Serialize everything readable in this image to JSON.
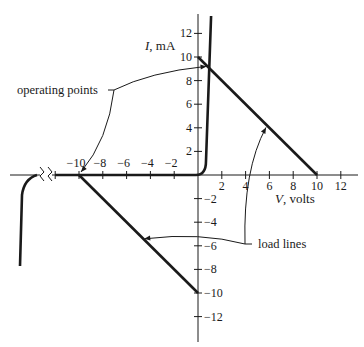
{
  "diagram": {
    "title": "",
    "x_axis": {
      "label_var": "V",
      "label_unit": ", volts",
      "range": [
        -13,
        13.5
      ],
      "ticks": [
        -12,
        -10,
        -8,
        -6,
        -4,
        -2,
        2,
        4,
        6,
        8,
        10,
        12
      ],
      "tick_labels": [
        {
          "value": -10,
          "text": "−10"
        },
        {
          "value": -8,
          "text": "−8"
        },
        {
          "value": -6,
          "text": "−6"
        },
        {
          "value": -4,
          "text": "−4"
        },
        {
          "value": -2,
          "text": "−2"
        },
        {
          "value": 2,
          "text": "2"
        },
        {
          "value": 4,
          "text": "4"
        },
        {
          "value": 6,
          "text": "6"
        },
        {
          "value": 8,
          "text": "8"
        },
        {
          "value": 10,
          "text": "10"
        },
        {
          "value": 12,
          "text": "12"
        }
      ],
      "break_marks": true
    },
    "y_axis": {
      "label_var": "I",
      "label_unit": ", mA",
      "range": [
        -14,
        13.5
      ],
      "ticks": [
        12,
        10,
        8,
        6,
        4,
        2,
        -2,
        -4,
        -6,
        -8,
        -10,
        -12
      ],
      "tick_labels": [
        {
          "value": 12,
          "text": "12"
        },
        {
          "value": 10,
          "text": "10"
        },
        {
          "value": 8,
          "text": "8"
        },
        {
          "value": 6,
          "text": "6"
        },
        {
          "value": 4,
          "text": "4"
        },
        {
          "value": 2,
          "text": "2"
        },
        {
          "value": -2,
          "text": "−2"
        },
        {
          "value": -4,
          "text": "−4"
        },
        {
          "value": -6,
          "text": "−6"
        },
        {
          "value": -8,
          "text": "−8"
        },
        {
          "value": -10,
          "text": "−10"
        },
        {
          "value": -12,
          "text": "−12"
        }
      ]
    },
    "curves": {
      "diode_characteristic": {
        "description": "Diode I-V curve: flat at I=0 for negative V, sharp rise near V≈0.7",
        "points": [
          [
            -12,
            0
          ],
          [
            0,
            0
          ],
          [
            0.6,
            0.6
          ],
          [
            0.75,
            2
          ],
          [
            1.0,
            13.2
          ]
        ]
      },
      "reverse_breakdown": {
        "description": "Reverse breakdown beyond axis break",
        "points_px_note": "drawn left of break marks"
      },
      "load_line_forward": {
        "from": [
          0,
          10
        ],
        "to": [
          10,
          0
        ]
      },
      "load_line_reverse": {
        "from": [
          -10,
          0
        ],
        "to": [
          0,
          -10
        ]
      }
    },
    "operating_points": [
      {
        "V": 0.8,
        "I": 9.2
      },
      {
        "V": -10,
        "I": 0
      }
    ],
    "callouts": {
      "operating_points": "operating points",
      "load_lines": "load lines"
    },
    "colors": {
      "ink": "#1a1a1a",
      "background": "#ffffff"
    }
  }
}
